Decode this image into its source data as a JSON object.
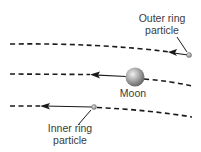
{
  "diagram": {
    "labels": {
      "outer_line1": "Outer ring",
      "outer_line2": "particle",
      "moon": "Moon",
      "inner_line1": "Inner ring",
      "inner_line2": "particle"
    },
    "colors": {
      "line": "#1a1a1a",
      "text": "#3a3a3a",
      "moon_light": "#e6e6e6",
      "moon_dark": "#6e6e6e",
      "particle": "#9a9a9a",
      "background": "#ffffff"
    },
    "elements": [
      {
        "id": "outer-orbit",
        "type": "dashed-curve"
      },
      {
        "id": "moon-orbit",
        "type": "dashed-curve"
      },
      {
        "id": "inner-orbit",
        "type": "dashed-curve"
      },
      {
        "id": "outer-particle",
        "motion": "leftward"
      },
      {
        "id": "moon",
        "motion": "leftward"
      },
      {
        "id": "inner-particle",
        "motion": "leftward"
      }
    ]
  }
}
